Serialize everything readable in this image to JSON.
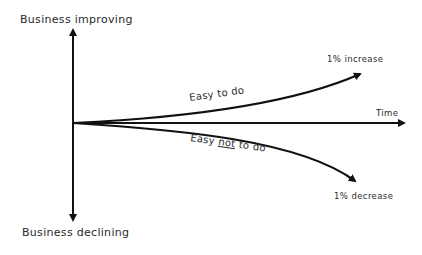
{
  "diagram": {
    "y_axis": {
      "top_label": "Business improving",
      "bottom_label": "Business declining"
    },
    "x_axis": {
      "label": "Time"
    },
    "curves": [
      {
        "name": "upper",
        "label": "Easy to do",
        "end_label": "1% increase"
      },
      {
        "name": "lower",
        "label_prefix": "Easy ",
        "label_emphasis": "not",
        "label_suffix": " to do",
        "end_label": "1% decrease"
      }
    ],
    "colors": {
      "stroke": "#111111",
      "text": "#2a2a2a",
      "background": "#ffffff"
    }
  }
}
